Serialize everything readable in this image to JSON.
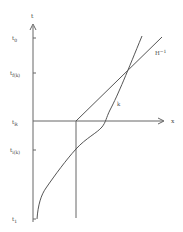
{
  "axes": {
    "vertical_label": "t",
    "horizontal_label": "x"
  },
  "ticks": [
    {
      "id": "t0",
      "base": "t",
      "sub": "0",
      "y": 38
    },
    {
      "id": "tf",
      "base": "t",
      "sub": "f(k)",
      "y": 73
    },
    {
      "id": "tR",
      "base": "t",
      "sub": "R",
      "y": 121
    },
    {
      "id": "ti",
      "base": "t",
      "sub": "i(k)",
      "y": 150
    },
    {
      "id": "t1",
      "base": "t",
      "sub": "1",
      "y": 219
    }
  ],
  "curves": {
    "line_label": "H",
    "line_sup": "−1",
    "curve_label": "k"
  },
  "colors": {
    "line": "#555555",
    "axis": "#666666",
    "text": "#444444"
  }
}
